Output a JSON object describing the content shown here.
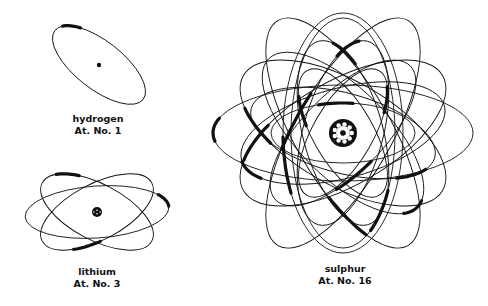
{
  "atoms": [
    {
      "id": "hydrogen",
      "name": "hydrogen",
      "number_label": "At. No. 1",
      "atomic_number": 1,
      "electrons": 1
    },
    {
      "id": "lithium",
      "name": "lithium",
      "number_label": "At. No. 3",
      "atomic_number": 3,
      "electrons": 3
    },
    {
      "id": "sulphur",
      "name": "sulphur",
      "number_label": "At. No. 16",
      "atomic_number": 16,
      "electrons": 16
    }
  ],
  "colors": {
    "ink": "#111111",
    "background": "#ffffff"
  }
}
